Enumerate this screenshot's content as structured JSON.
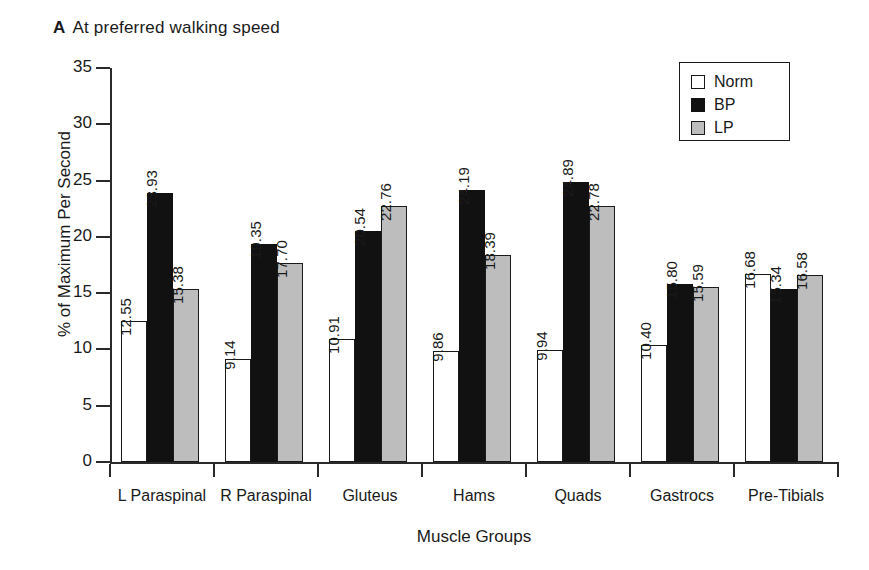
{
  "panel": {
    "tag": "A",
    "title": "At preferred walking speed"
  },
  "axes": {
    "ylabel": "% of Maximum Per Second",
    "xlabel": "Muscle Groups",
    "yticks": [
      "35",
      "30",
      "25",
      "20",
      "15",
      "10",
      "5",
      "0"
    ]
  },
  "legend": {
    "items": [
      {
        "label": "Norm",
        "color": "#ffffff",
        "swatch": "norm"
      },
      {
        "label": "BP",
        "color": "#111111",
        "swatch": "bp"
      },
      {
        "label": "LP",
        "color": "#bdbdbd",
        "swatch": "lp"
      }
    ]
  },
  "chart_data": {
    "type": "bar",
    "title": "At preferred walking speed",
    "xlabel": "Muscle Groups",
    "ylabel": "% of Maximum Per Second",
    "ylim": [
      0,
      35
    ],
    "ytick_step": 5,
    "grid": false,
    "legend_position": "top-right",
    "categories": [
      "L Paraspinal",
      "R Paraspinal",
      "Gluteus",
      "Hams",
      "Quads",
      "Gastrocs",
      "Pre-Tibials"
    ],
    "series": [
      {
        "name": "Norm",
        "color": "#ffffff",
        "values": [
          12.55,
          9.14,
          10.91,
          9.86,
          9.94,
          10.4,
          16.68
        ],
        "labels": [
          "12.55",
          "9.14",
          "10.91",
          "9.86",
          "9.94",
          "10.40",
          "16.68"
        ]
      },
      {
        "name": "BP",
        "color": "#111111",
        "values": [
          23.93,
          19.35,
          20.54,
          24.19,
          24.89,
          15.8,
          15.34
        ],
        "labels": [
          "23.93",
          "19.35",
          "20.54",
          "24.19",
          "24.89",
          "15.80",
          "15.34"
        ]
      },
      {
        "name": "LP",
        "color": "#bdbdbd",
        "values": [
          15.38,
          17.7,
          22.76,
          18.39,
          22.78,
          15.59,
          16.58
        ],
        "labels": [
          "15.38",
          "17.70",
          "22.76",
          "18.39",
          "22.78",
          "15.59",
          "16.58"
        ]
      }
    ]
  }
}
